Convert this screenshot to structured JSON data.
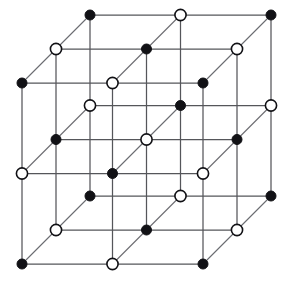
{
  "figure": {
    "projection": "oblique",
    "background_color": "#ffffff"
  },
  "geometry": {
    "grid_counts": [
      3,
      3,
      3
    ],
    "origin": [
      22,
      83
    ],
    "step_x": 90.5,
    "step_y": 90.5,
    "depth_dx": 34.0,
    "depth_dy": -34.0,
    "site_radius_filled": 5.0,
    "site_radius_open": 5.6
  },
  "style": {
    "line_color": "#55565a",
    "line_color_depth": "#6a6b70",
    "line_width": 1.25,
    "filled_color": "#111115",
    "open_fill_color": "#ffffff",
    "open_stroke_color": "#111115"
  },
  "legend": {
    "filled_label": "filled site",
    "open_label": "open site",
    "parity_rule": "filled when i+j+k is even, open when i+j+k is odd"
  },
  "chart_data": {
    "type": "scatter",
    "xlabel": "",
    "ylabel": "",
    "sites": [
      {
        "ijk": [
          0,
          0,
          0
        ],
        "px": [
          22,
          83
        ],
        "kind": "filled"
      },
      {
        "ijk": [
          1,
          0,
          0
        ],
        "px": [
          112.5,
          83
        ],
        "kind": "open"
      },
      {
        "ijk": [
          2,
          0,
          0
        ],
        "px": [
          203,
          83
        ],
        "kind": "filled"
      },
      {
        "ijk": [
          0,
          1,
          0
        ],
        "px": [
          22,
          173.5
        ],
        "kind": "open"
      },
      {
        "ijk": [
          1,
          1,
          0
        ],
        "px": [
          112.5,
          173.5
        ],
        "kind": "filled"
      },
      {
        "ijk": [
          2,
          1,
          0
        ],
        "px": [
          203,
          173.5
        ],
        "kind": "open"
      },
      {
        "ijk": [
          0,
          2,
          0
        ],
        "px": [
          22,
          264
        ],
        "kind": "filled"
      },
      {
        "ijk": [
          1,
          2,
          0
        ],
        "px": [
          112.5,
          264
        ],
        "kind": "open"
      },
      {
        "ijk": [
          2,
          2,
          0
        ],
        "px": [
          203,
          264
        ],
        "kind": "filled"
      },
      {
        "ijk": [
          0,
          0,
          1
        ],
        "px": [
          56,
          49
        ],
        "kind": "open"
      },
      {
        "ijk": [
          1,
          0,
          1
        ],
        "px": [
          146.5,
          49
        ],
        "kind": "filled"
      },
      {
        "ijk": [
          2,
          0,
          1
        ],
        "px": [
          237,
          49
        ],
        "kind": "open"
      },
      {
        "ijk": [
          0,
          1,
          1
        ],
        "px": [
          56,
          139.5
        ],
        "kind": "filled"
      },
      {
        "ijk": [
          1,
          1,
          1
        ],
        "px": [
          146.5,
          139.5
        ],
        "kind": "open"
      },
      {
        "ijk": [
          2,
          1,
          1
        ],
        "px": [
          237,
          139.5
        ],
        "kind": "filled"
      },
      {
        "ijk": [
          0,
          2,
          1
        ],
        "px": [
          56,
          230
        ],
        "kind": "open"
      },
      {
        "ijk": [
          1,
          2,
          1
        ],
        "px": [
          146.5,
          230
        ],
        "kind": "filled"
      },
      {
        "ijk": [
          2,
          2,
          1
        ],
        "px": [
          237,
          230
        ],
        "kind": "open"
      },
      {
        "ijk": [
          0,
          0,
          2
        ],
        "px": [
          90,
          15
        ],
        "kind": "filled"
      },
      {
        "ijk": [
          1,
          0,
          2
        ],
        "px": [
          180.5,
          15
        ],
        "kind": "open"
      },
      {
        "ijk": [
          2,
          0,
          2
        ],
        "px": [
          271,
          15
        ],
        "kind": "filled"
      },
      {
        "ijk": [
          0,
          1,
          2
        ],
        "px": [
          90,
          105.5
        ],
        "kind": "open"
      },
      {
        "ijk": [
          1,
          1,
          2
        ],
        "px": [
          180.5,
          105.5
        ],
        "kind": "filled"
      },
      {
        "ijk": [
          2,
          1,
          2
        ],
        "px": [
          271,
          105.5
        ],
        "kind": "open"
      },
      {
        "ijk": [
          0,
          2,
          2
        ],
        "px": [
          90,
          196
        ],
        "kind": "filled"
      },
      {
        "ijk": [
          1,
          2,
          2
        ],
        "px": [
          180.5,
          196
        ],
        "kind": "open"
      },
      {
        "ijk": [
          2,
          2,
          2
        ],
        "px": [
          271,
          196
        ],
        "kind": "filled"
      }
    ]
  }
}
